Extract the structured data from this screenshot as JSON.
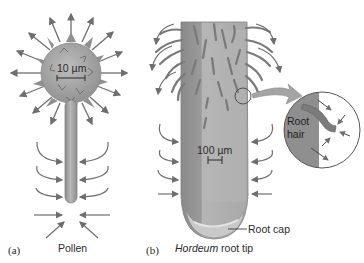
{
  "panels": {
    "a": {
      "letter": "(a)",
      "caption": "Pollen",
      "scale_label": "10 µm"
    },
    "b": {
      "letter": "(b)",
      "caption_italic": "Hordeum",
      "caption_rest": " root tip",
      "scale_label": "100 µm",
      "callout_root_cap": "Root cap",
      "inset_label_line1": "Root",
      "inset_label_line2": "hair"
    }
  },
  "colors": {
    "arrow": "#6e6e6e",
    "grain": "#a9a9a9",
    "tube": "#9b9b9b",
    "root_dark": "#8c8c8c",
    "root_light": "#b9b9b9",
    "hair": "#7a7a7a",
    "text": "#2a2a2a"
  }
}
